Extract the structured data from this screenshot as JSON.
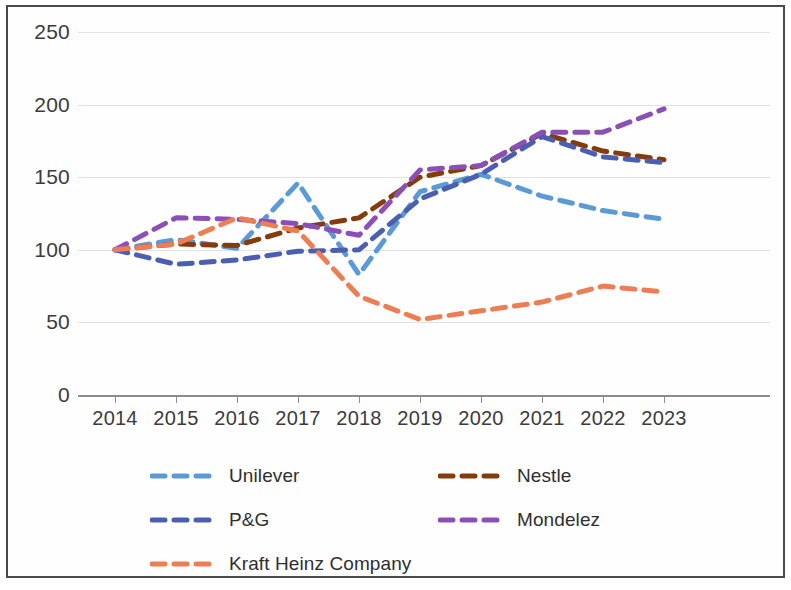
{
  "chart_data": {
    "type": "line",
    "title": "",
    "subtitle": "",
    "xlabel": "",
    "ylabel": "",
    "categories": [
      "2014",
      "2015",
      "2016",
      "2017",
      "2018",
      "2019",
      "2020",
      "2021",
      "2022",
      "2023"
    ],
    "x": [
      2014,
      2015,
      2016,
      2017,
      2018,
      2019,
      2020,
      2021,
      2022,
      2023
    ],
    "xlim": [
      2014,
      2023
    ],
    "ylim": [
      0,
      250
    ],
    "ytick_labels": [
      "0",
      "50",
      "100",
      "150",
      "200",
      "250"
    ],
    "ytick_values": [
      0,
      50,
      100,
      150,
      200,
      250
    ],
    "grid": true,
    "legend_position": "bottom",
    "line_style": "dashed",
    "markers": false,
    "series": [
      {
        "name": "Unilever",
        "color": "#5B9BD5",
        "values": [
          100,
          107,
          101,
          146,
          83,
          140,
          152,
          137,
          127,
          121
        ]
      },
      {
        "name": "Nestle",
        "color": "#843C0C",
        "values": [
          100,
          104,
          103,
          115,
          122,
          150,
          158,
          180,
          168,
          162
        ]
      },
      {
        "name": "P&G",
        "color": "#4A5FAF",
        "values": [
          100,
          90,
          93,
          99,
          100,
          135,
          152,
          178,
          164,
          160
        ]
      },
      {
        "name": "Mondelez",
        "color": "#8B4FB5",
        "values": [
          100,
          122,
          121,
          118,
          110,
          155,
          158,
          181,
          181,
          197
        ]
      },
      {
        "name": "Kraft Heinz Company",
        "color": "#ED7D52",
        "values": [
          100,
          104,
          122,
          113,
          68,
          52,
          58,
          64,
          75,
          71
        ]
      }
    ]
  },
  "axes": {
    "y_ticks": [
      {
        "label": "250",
        "value": 250
      },
      {
        "label": "200",
        "value": 200
      },
      {
        "label": "150",
        "value": 150
      },
      {
        "label": "100",
        "value": 100
      },
      {
        "label": "50",
        "value": 50
      },
      {
        "label": "0",
        "value": 0
      }
    ],
    "x_ticks": [
      {
        "label": "2014"
      },
      {
        "label": "2015"
      },
      {
        "label": "2016"
      },
      {
        "label": "2017"
      },
      {
        "label": "2018"
      },
      {
        "label": "2019"
      },
      {
        "label": "2020"
      },
      {
        "label": "2021"
      },
      {
        "label": "2022"
      },
      {
        "label": "2023"
      }
    ]
  },
  "legend": {
    "entries": [
      {
        "label": "Unilever",
        "color": "#5B9BD5"
      },
      {
        "label": "Nestle",
        "color": "#843C0C"
      },
      {
        "label": "P&G",
        "color": "#4A5FAF"
      },
      {
        "label": "Mondelez",
        "color": "#8B4FB5"
      },
      {
        "label": "Kraft Heinz Company",
        "color": "#ED7D52"
      }
    ]
  }
}
